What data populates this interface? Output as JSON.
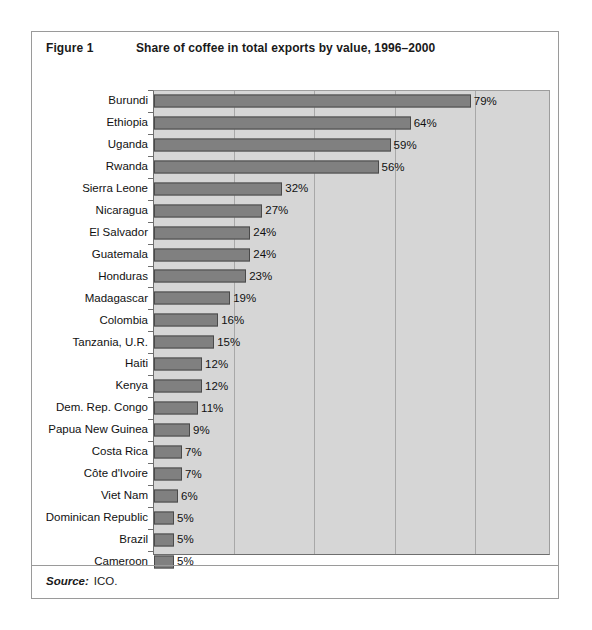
{
  "figure": {
    "label": "Figure 1",
    "title": "Share of coffee in total exports by value, 1996–2000",
    "source_word": "Source:",
    "source_value": "ICO."
  },
  "colors": {
    "bar_fill": "#808080",
    "bar_border": "#4a4a4a",
    "plot_background": "#d6d6d6",
    "gridline": "#a8a8a8",
    "frame": "#9a9a9a",
    "text": "#111111"
  },
  "chart_data": {
    "type": "bar",
    "orientation": "horizontal",
    "title": "Share of coffee in total exports by value, 1996–2000",
    "xlabel": "",
    "ylabel": "",
    "xlim": [
      0,
      99
    ],
    "grid": true,
    "gridlines": [
      20,
      40,
      60,
      80
    ],
    "legend": "none",
    "value_suffix": "%",
    "categories": [
      "Burundi",
      "Ethiopia",
      "Uganda",
      "Rwanda",
      "Sierra Leone",
      "Nicaragua",
      "El Salvador",
      "Guatemala",
      "Honduras",
      "Madagascar",
      "Colombia",
      "Tanzania, U.R.",
      "Haiti",
      "Kenya",
      "Dem. Rep. Congo",
      "Papua New Guinea",
      "Costa Rica",
      "Côte d'Ivoire",
      "Viet Nam",
      "Dominican Republic",
      "Brazil",
      "Cameroon"
    ],
    "values": [
      79,
      64,
      59,
      56,
      32,
      27,
      24,
      24,
      23,
      19,
      16,
      15,
      12,
      12,
      11,
      9,
      7,
      7,
      6,
      5,
      5,
      5
    ],
    "labels": [
      "79%",
      "64%",
      "59%",
      "56%",
      "32%",
      "27%",
      "24%",
      "24%",
      "23%",
      "19%",
      "16%",
      "15%",
      "12%",
      "12%",
      "11%",
      "9%",
      "7%",
      "7%",
      "6%",
      "5%",
      "5%",
      "5%"
    ]
  }
}
